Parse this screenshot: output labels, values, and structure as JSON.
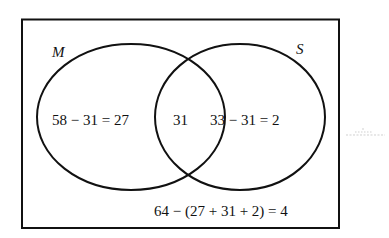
{
  "diagram": {
    "type": "venn",
    "universe": {
      "total": 64
    },
    "sets": [
      {
        "id": "M",
        "label": "M",
        "total": 58
      },
      {
        "id": "S",
        "label": "S",
        "total": 33
      }
    ],
    "regions": {
      "only_M": {
        "expression": "58 − 31 = 27",
        "value": 27
      },
      "intersection": {
        "expression": "31",
        "value": 31
      },
      "only_S": {
        "expression": "33 − 31 = 2",
        "value": 2
      },
      "outside": {
        "expression": "64 − (27 + 31 + 2) = 4",
        "value": 4
      }
    },
    "colors": {
      "stroke": "#111111",
      "background": "#ffffff"
    }
  }
}
